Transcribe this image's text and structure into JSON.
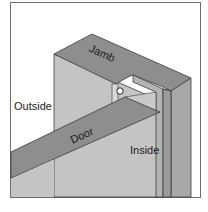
{
  "figure": {
    "labels": {
      "jamb": "Jamb",
      "outside": "Outside",
      "door": "Door",
      "inside": "Inside"
    },
    "colors": {
      "frame_border": "#6f6f6f",
      "background": "#ffffff",
      "jamb_top": "#8e8e8e",
      "wall_face": "#c4c4c4",
      "jamb_side": "#a8a8a8",
      "door_top": "#8e8e8e",
      "door_face": "#c9c9c9",
      "edge": "#3a3a3a",
      "weatherstrip": "#ffffff"
    }
  }
}
